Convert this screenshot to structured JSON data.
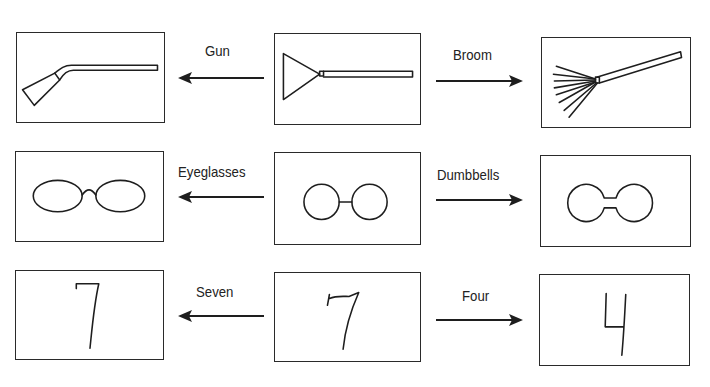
{
  "rows": [
    {
      "center": {
        "image": "broom-or-gun-ambiguous-figure"
      },
      "left": {
        "label": "Gun",
        "image": "gun-drawing"
      },
      "right": {
        "label": "Broom",
        "image": "broom-drawing"
      }
    },
    {
      "center": {
        "image": "two-circles-joined-figure"
      },
      "left": {
        "label": "Eyeglasses",
        "image": "eyeglasses-drawing"
      },
      "right": {
        "label": "Dumbbells",
        "image": "dumbbells-drawing"
      }
    },
    {
      "center": {
        "image": "ambiguous-seven-four-figure"
      },
      "left": {
        "label": "Seven",
        "image": "seven-digit-drawing"
      },
      "right": {
        "label": "Four",
        "image": "four-digit-drawing"
      }
    }
  ],
  "colors": {
    "line": "#1e1e1e",
    "background": "#ffffff"
  }
}
